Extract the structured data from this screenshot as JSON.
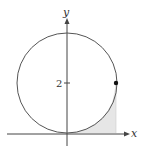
{
  "figure": {
    "type": "circle-with-shaded-region",
    "axes": {
      "x_label": "x",
      "y_label": "y"
    },
    "ticks": {
      "y": [
        {
          "value": 2,
          "label": "2"
        }
      ]
    },
    "circle": {
      "center": [
        0,
        2
      ],
      "radius": 2,
      "stroke": "#555555"
    },
    "point": {
      "coords": [
        2,
        2
      ],
      "color": "#111111"
    },
    "shaded_region": {
      "description": "region between x-axis, lower-right arc of circle, and vertical line x = 2",
      "fill": "#e6e6e6"
    },
    "colors": {
      "axis": "#444444",
      "background": "#ffffff"
    }
  }
}
